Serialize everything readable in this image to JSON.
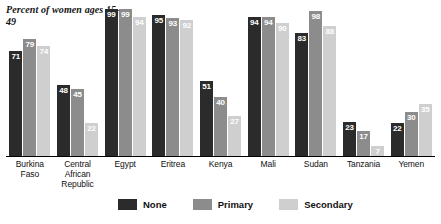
{
  "chart_data": {
    "type": "bar",
    "title": "",
    "note": "Percent of women ages 15–49",
    "xlabel": "",
    "ylabel": "Percent of women ages 15–49",
    "ylim": [
      0,
      100
    ],
    "grid": false,
    "legend_position": "bottom",
    "categories": [
      "Burkina Faso",
      "Central African Republic",
      "Egypt",
      "Eritrea",
      "Kenya",
      "Mali",
      "Sudan",
      "Tanzania",
      "Yemen"
    ],
    "series": [
      {
        "name": "None",
        "color": "#2b2b2b",
        "values": [
          71,
          48,
          99,
          95,
          51,
          94,
          83,
          23,
          22
        ]
      },
      {
        "name": "Primary",
        "color": "#8c8c8c",
        "values": [
          79,
          45,
          99,
          93,
          40,
          94,
          98,
          17,
          30
        ]
      },
      {
        "name": "Secondary",
        "color": "#cfcfcf",
        "values": [
          74,
          22,
          94,
          92,
          27,
          90,
          88,
          7,
          35
        ]
      }
    ]
  },
  "categories_display": [
    [
      "Burkina",
      "Faso"
    ],
    [
      "Central",
      "African",
      "Republic"
    ],
    [
      "Egypt"
    ],
    [
      "Eritrea"
    ],
    [
      "Kenya"
    ],
    [
      "Mali"
    ],
    [
      "Sudan"
    ],
    [
      "Tanzania"
    ],
    [
      "Yemen"
    ]
  ],
  "legend": {
    "items": [
      {
        "label": "None",
        "color": "#2b2b2b"
      },
      {
        "label": "Primary",
        "color": "#8c8c8c"
      },
      {
        "label": "Secondary",
        "color": "#cfcfcf"
      }
    ]
  }
}
